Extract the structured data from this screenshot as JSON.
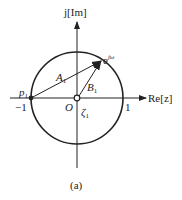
{
  "figure": {
    "caption": "(a)",
    "colors": {
      "stroke": "#222222",
      "background": "#ffffff"
    }
  },
  "axes": {
    "real_label": "Re[z]",
    "imag_label": "j[Im]",
    "origin_label": "O",
    "tick_neg_one": "−1",
    "tick_pos_one": "1"
  },
  "points": {
    "pole": {
      "name": "p",
      "sub": "1",
      "x": -1,
      "y": 0
    },
    "zero": {
      "name": "ζ",
      "sub": "1",
      "x": 0,
      "y": 0
    },
    "unit_point": {
      "name": "e",
      "sup": "jω"
    }
  },
  "vectors": {
    "A": {
      "name": "A",
      "sub": "1",
      "from": "p1",
      "to": "e^jω"
    },
    "B": {
      "name": "B",
      "sub": "1",
      "from": "O",
      "to": "e^jω"
    }
  },
  "circle": {
    "label": "unit circle",
    "radius": 1
  }
}
